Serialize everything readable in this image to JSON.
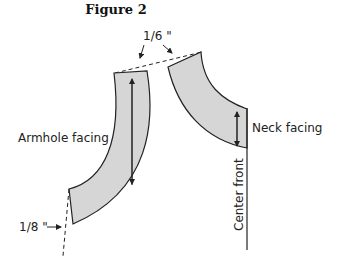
{
  "figure": {
    "title": "Figure 2",
    "labels": {
      "top_measure": "1/6 \"",
      "bottom_measure": "1/8 \"",
      "armhole": "Armhole facing",
      "neck": "Neck facing",
      "center_front": "Center front"
    },
    "colors": {
      "fill": "#d6d6d6",
      "stroke": "#222222"
    }
  }
}
